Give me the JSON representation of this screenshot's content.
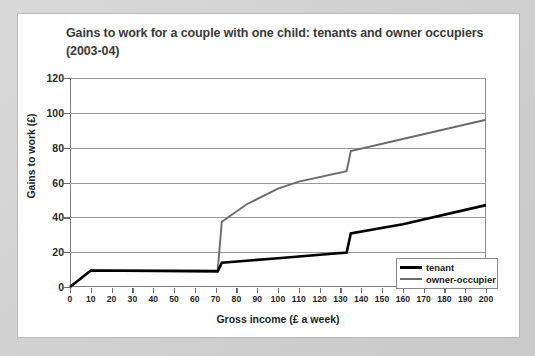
{
  "chart_data": {
    "type": "line",
    "title": "Gains to work for a couple with one child: tenants and owner occupiers (2003-04)",
    "title_line1": "Gains to work for a couple with one child: tenants and owner",
    "title_line2": "occupiers (2003-04)",
    "xlabel": "Gross income (£ a week)",
    "ylabel": "Gains to work (£)",
    "xlim": [
      0,
      200
    ],
    "ylim": [
      0,
      120
    ],
    "xticks": [
      0,
      10,
      20,
      30,
      40,
      50,
      60,
      70,
      80,
      90,
      100,
      110,
      120,
      130,
      140,
      150,
      160,
      170,
      180,
      190,
      200
    ],
    "yticks": [
      0,
      20,
      40,
      60,
      80,
      100,
      120
    ],
    "grid": "horizontal",
    "legend_position": "bottom-right",
    "series": [
      {
        "name": "tenant",
        "color": "#000000",
        "points": [
          [
            0,
            0
          ],
          [
            10,
            9.5
          ],
          [
            71,
            9.0
          ],
          [
            73,
            14.0
          ],
          [
            100,
            16.5
          ],
          [
            133,
            19.8
          ],
          [
            135,
            30.8
          ],
          [
            160,
            36.0
          ],
          [
            200,
            47.0
          ]
        ]
      },
      {
        "name": "owner-occupier",
        "color": "#6b6b6b",
        "points": [
          [
            0,
            0
          ],
          [
            10,
            9.5
          ],
          [
            71,
            9.5
          ],
          [
            73,
            37.5
          ],
          [
            85,
            47.5
          ],
          [
            100,
            56.5
          ],
          [
            110,
            60.5
          ],
          [
            133,
            66.5
          ],
          [
            135,
            78.0
          ],
          [
            160,
            85.0
          ],
          [
            200,
            96.0
          ]
        ]
      }
    ]
  },
  "legend": {
    "items": [
      {
        "label": "tenant"
      },
      {
        "label": "owner-occupier"
      }
    ]
  },
  "colors": {
    "tenant": "#000000",
    "owner_occupier": "#6b6b6b",
    "frame": "#cfcfcf",
    "grid": "#9a9a9a",
    "title_text": "#3a3a3a"
  }
}
